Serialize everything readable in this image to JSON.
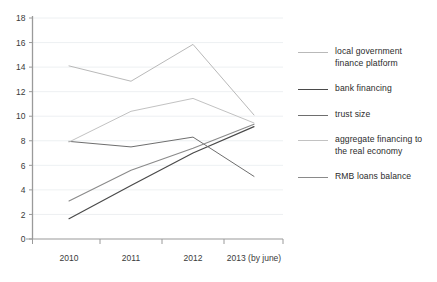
{
  "chart_data": {
    "type": "line",
    "title": "",
    "subtitle": "",
    "xlabel": "",
    "ylabel": "",
    "categories": [
      "2010",
      "2011",
      "2012",
      "2013 (by june)"
    ],
    "xlim": [
      0,
      3
    ],
    "ylim": [
      0,
      18
    ],
    "ytick_step": 2,
    "yticks": [
      "0",
      "2",
      "4",
      "6",
      "8",
      "10",
      "12",
      "14",
      "16",
      "18"
    ],
    "grid": true,
    "grid_color": "#e9ecef",
    "legend_position": "right",
    "axis_color": "#9a9a9a",
    "series": [
      {
        "name": "local government finance platform",
        "color": "#b9b9b9",
        "width": 1.0,
        "values": [
          14.1,
          12.85,
          15.85,
          10.1
        ]
      },
      {
        "name": "bank financing",
        "color": "#4a4a4a",
        "width": 1.2,
        "values": [
          1.65,
          4.35,
          7.0,
          9.15
        ]
      },
      {
        "name": "trust size",
        "color": "#6e6e6e",
        "width": 1.0,
        "values": [
          7.95,
          7.5,
          8.3,
          5.1
        ]
      },
      {
        "name": "aggregate financing to the real economy",
        "color": "#c2c2c2",
        "width": 1.0,
        "values": [
          7.9,
          10.4,
          11.45,
          9.45
        ]
      },
      {
        "name": "RMB loans balance",
        "color": "#8a8a8a",
        "width": 1.1,
        "values": [
          3.1,
          5.6,
          7.4,
          9.35
        ]
      }
    ]
  },
  "legend": {
    "items": [
      {
        "label": "local government\nfinance platform",
        "color": "#b9b9b9",
        "width": 1.0
      },
      {
        "label": "bank financing",
        "color": "#4a4a4a",
        "width": 1.4
      },
      {
        "label": "trust size",
        "color": "#6e6e6e",
        "width": 1.1
      },
      {
        "label": "aggregate financing to\nthe real economy",
        "color": "#c2c2c2",
        "width": 1.0
      },
      {
        "label": "RMB loans balance",
        "color": "#8a8a8a",
        "width": 1.2
      }
    ]
  }
}
